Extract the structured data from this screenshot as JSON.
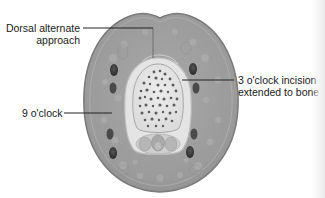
{
  "figure": {
    "colors": {
      "outer_tissue": "#9a9a9a",
      "outer_rim": "#7d7d7d",
      "sheath_ring": "#d7d7d7",
      "bone_fill": "#e8e8e8",
      "bone_spots": "#5a5a5a",
      "vessels": "#3a3a3a",
      "text": "#1a1a1a",
      "leader_line": "#222222"
    }
  },
  "labels": {
    "dorsal_line1": "Dorsal alternate",
    "dorsal_line2": "approach",
    "three_oclock_line1": "3 o'clock incision",
    "three_oclock_line2": "extended to bone",
    "nine_oclock": "9 o'clock"
  }
}
